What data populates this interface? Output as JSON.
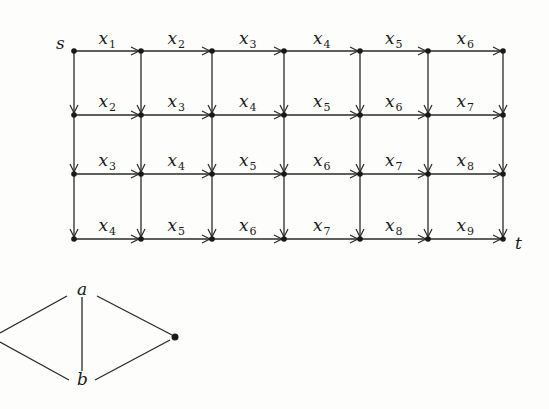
{
  "grid_graph": {
    "source_label": "s",
    "sink_label": "t",
    "variable_symbol": "x",
    "columns_x": [
      74,
      141,
      212,
      284,
      360,
      428,
      503
    ],
    "rows_y": [
      51,
      115,
      174,
      239
    ],
    "label_rows_y": [
      44,
      107,
      166,
      231
    ],
    "horizontal_edge_labels": [
      [
        "1",
        "2",
        "3",
        "4",
        "5",
        "6"
      ],
      [
        "2",
        "3",
        "4",
        "5",
        "6",
        "7"
      ],
      [
        "3",
        "4",
        "5",
        "6",
        "7",
        "8"
      ],
      [
        "4",
        "5",
        "6",
        "7",
        "8",
        "9"
      ]
    ],
    "edge_direction": {
      "horizontal": "right",
      "vertical": "down"
    }
  },
  "small_graph": {
    "vertices": [
      {
        "id": "left",
        "label": "",
        "x": 0,
        "y": 333,
        "dot": false
      },
      {
        "id": "a",
        "label": "a",
        "x": 82,
        "y": 290,
        "dot": false
      },
      {
        "id": "b",
        "label": "b",
        "x": 82,
        "y": 380,
        "dot": false
      },
      {
        "id": "right",
        "label": "",
        "x": 175,
        "y": 337,
        "dot": true
      }
    ],
    "edges": [
      {
        "from": "left",
        "to": "a",
        "x1": 0,
        "y1": 333,
        "x2": 67,
        "y2": 296
      },
      {
        "from": "left",
        "to": "b",
        "x1": 0,
        "y1": 342,
        "x2": 69,
        "y2": 380
      },
      {
        "from": "a",
        "to": "b",
        "x1": 82,
        "y1": 297,
        "x2": 82,
        "y2": 371
      },
      {
        "from": "a",
        "to": "right",
        "x1": 97,
        "y1": 296,
        "x2": 172,
        "y2": 335
      },
      {
        "from": "b",
        "to": "right",
        "x1": 95,
        "y1": 380,
        "x2": 170,
        "y2": 340
      }
    ]
  }
}
